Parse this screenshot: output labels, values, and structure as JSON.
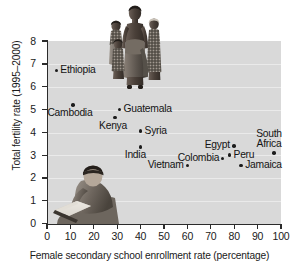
{
  "chart_data": {
    "type": "scatter",
    "title": "",
    "xlabel": "Female secondary school enrollment rate (percentage)",
    "ylabel": "Total fertility rate (1995–2000)",
    "xlim": [
      0,
      100
    ],
    "ylim": [
      0,
      8
    ],
    "xticks": [
      "0",
      "10",
      "20",
      "30",
      "40",
      "50",
      "60",
      "70",
      "80",
      "90",
      "100"
    ],
    "yticks": [
      "0",
      "1",
      "2",
      "3",
      "4",
      "5",
      "6",
      "7",
      "8"
    ],
    "grid": true,
    "legend": "none",
    "points": [
      {
        "name": "Ethiopia",
        "x": 4,
        "y": 6.7,
        "label_pos": "right"
      },
      {
        "name": "Cambodia",
        "x": 11,
        "y": 5.2,
        "label_pos": "below-left"
      },
      {
        "name": "Kenya",
        "x": 29,
        "y": 4.65,
        "label_pos": "below-left"
      },
      {
        "name": "Guatemala",
        "x": 31,
        "y": 5.0,
        "label_pos": "right"
      },
      {
        "name": "Syria",
        "x": 40,
        "y": 4.05,
        "label_pos": "right"
      },
      {
        "name": "India",
        "x": 40,
        "y": 3.35,
        "label_pos": "below-left"
      },
      {
        "name": "Vietnam",
        "x": 60,
        "y": 2.55,
        "label_pos": "left"
      },
      {
        "name": "Colombia",
        "x": 75,
        "y": 2.85,
        "label_pos": "left"
      },
      {
        "name": "Egypt",
        "x": 80,
        "y": 3.4,
        "label_pos": "left"
      },
      {
        "name": "Peru",
        "x": 78,
        "y": 3.0,
        "label_pos": "right"
      },
      {
        "name": "Jamaica",
        "x": 83,
        "y": 2.55,
        "label_pos": "right"
      },
      {
        "name": "South Africa",
        "x": 97,
        "y": 3.1,
        "label_pos": "above"
      }
    ],
    "point_labels": {
      "ethiopia": "Ethiopia",
      "cambodia": "Cambodia",
      "kenya": "Kenya",
      "guatemala": "Guatemala",
      "syria": "Syria",
      "india": "India",
      "vietnam": "Vietnam",
      "colombia": "Colombia",
      "egypt": "Egypt",
      "peru": "Peru",
      "jamaica": "Jamaica",
      "south_africa_line1": "South",
      "south_africa_line2": "Africa"
    },
    "colors": {
      "plot_background": "#d9d9d9",
      "gridline": "#eaeaea",
      "axis": "#2b2b2b",
      "marker": "#1c1c1c",
      "text": "#141414",
      "page_background": "#ffffff"
    },
    "photos": [
      {
        "name": "family-photo",
        "caption": ""
      },
      {
        "name": "woman-reading-photo",
        "caption": ""
      }
    ]
  }
}
